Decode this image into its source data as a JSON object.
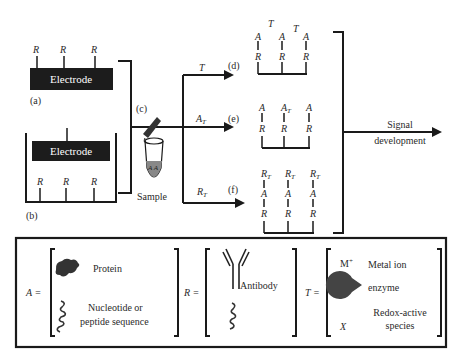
{
  "diagram": {
    "panel_a": {
      "label": "(a)",
      "electrode_label": "Electrode",
      "receptors": [
        "R",
        "R",
        "R"
      ]
    },
    "panel_b": {
      "label": "(b)",
      "electrode_label": "Electrode",
      "receptors": [
        "R",
        "R",
        "R"
      ]
    },
    "step_c": {
      "label": "(c)",
      "sample_label": "Sample",
      "sample_contents": "A A"
    },
    "branches": [
      {
        "label": "(d)",
        "arrow_label": "T",
        "layers": {
          "top": [
            "T",
            "",
            "T"
          ],
          "mid": [
            "A",
            "A",
            "A"
          ],
          "bottom": [
            "R",
            "R",
            "R"
          ]
        }
      },
      {
        "label": "(e)",
        "arrow_label": "A",
        "arrow_sub": "T",
        "layers": {
          "mid": [
            "A",
            "A",
            "A"
          ],
          "mid_sub": [
            "",
            "T",
            ""
          ],
          "bottom": [
            "R",
            "R",
            "R"
          ]
        }
      },
      {
        "label": "(f)",
        "arrow_label": "R",
        "arrow_sub": "T",
        "layers": {
          "top": [
            "R",
            "R",
            "R"
          ],
          "top_sub": [
            "T",
            "T",
            "T"
          ],
          "mid": [
            "A",
            "A",
            "A"
          ],
          "bottom": [
            "R",
            "R",
            "R"
          ]
        }
      }
    ],
    "output": {
      "line1": "Signal",
      "line2": "development"
    }
  },
  "legend": {
    "A": {
      "symbol": "A =",
      "items": [
        "Protein",
        "Nucleotide or",
        "peptide sequence"
      ]
    },
    "R": {
      "symbol": "R =",
      "items": [
        "Antibody"
      ]
    },
    "T": {
      "symbol": "T =",
      "items": [
        "Metal ion",
        "enzyme",
        "Redox-active",
        "species"
      ],
      "metal_symbol": "M",
      "metal_sup": "+",
      "redox_symbol": "X"
    }
  },
  "colors": {
    "ink": "#1a1a1a",
    "electrode_fill": "#1c1c1c",
    "sample_fill": "#888888",
    "enzyme_fill": "#444444"
  }
}
